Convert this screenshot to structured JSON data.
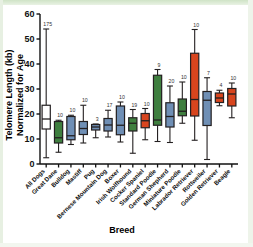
{
  "figure": {
    "background_color": "#ffffff",
    "frame_color": "#dfecd8"
  },
  "axes": {
    "y_title_line1": "Telomere Length (kb)",
    "y_title_line2": "Normalized for Age",
    "x_title": "Breed",
    "y_ticks": [
      "0",
      "10",
      "20",
      "30",
      "40",
      "50",
      "60"
    ],
    "y_min": 0,
    "y_max": 60
  },
  "colors": {
    "white_box": "#ffffff",
    "green_box": "#3f7f3f",
    "blue_box": "#6f8fb5",
    "red_box": "#d8451e",
    "outline": "#231f20"
  },
  "chart_data": {
    "type": "box",
    "title": "",
    "xlabel": "Breed",
    "ylabel": "Telomere Length (kb) Normalized for Age",
    "ylim": [
      0,
      60
    ],
    "grid": false,
    "legend": "none",
    "categories": [
      "All Dogs",
      "Great Dane",
      "Bulldog",
      "Mastiff",
      "Pug",
      "Bernese Mountain Dog",
      "Boxer",
      "Irish Wolfhound",
      "Cocker Spaniel",
      "Standard Poodle",
      "German Shepherd",
      "Miniature Poodle",
      "Labrador Retriever",
      "Rottweiler",
      "Golden Retriever",
      "Beagle"
    ],
    "n_labels": [
      "175",
      "10",
      "10",
      "10",
      "3",
      "17",
      "10",
      "19",
      "10",
      "9",
      "20",
      "10",
      "10",
      "7",
      "4",
      "10"
    ],
    "boxes": [
      {
        "breed": "All Dogs",
        "color": "#ffffff",
        "whisker_low": 2.5,
        "q1": 14.0,
        "median": 18.0,
        "q3": 23.5,
        "whisker_high": 54.0,
        "n": "175"
      },
      {
        "breed": "Great Dane",
        "color": "#3f7f3f",
        "whisker_low": 4.7,
        "q1": 8.4,
        "median": 10.5,
        "q3": 17.0,
        "whisker_high": 17.5,
        "n": "10"
      },
      {
        "breed": "Bulldog",
        "color": "#6f8fb5",
        "whisker_low": 7.8,
        "q1": 9.7,
        "median": 11.3,
        "q3": 19.0,
        "whisker_high": 19.5,
        "n": "10"
      },
      {
        "breed": "Mastiff",
        "color": "#6f8fb5",
        "whisker_low": 8.4,
        "q1": 11.8,
        "median": 14.2,
        "q3": 17.0,
        "whisker_high": 23.5,
        "n": "10"
      },
      {
        "breed": "Pug",
        "color": "#6f8fb5",
        "whisker_low": 10.5,
        "q1": 13.6,
        "median": 14.8,
        "q3": 15.8,
        "whisker_high": 16.0,
        "n": "3"
      },
      {
        "breed": "Bernese Mountain Dog",
        "color": "#6f8fb5",
        "whisker_low": 10.8,
        "q1": 13.2,
        "median": 15.6,
        "q3": 18.2,
        "whisker_high": 21.5,
        "n": "17"
      },
      {
        "breed": "Boxer",
        "color": "#6f8fb5",
        "whisker_low": 8.8,
        "q1": 11.7,
        "median": 15.5,
        "q3": 23.2,
        "whisker_high": 24.8,
        "n": "10"
      },
      {
        "breed": "Irish Wolfhound",
        "color": "#3f7f3f",
        "whisker_low": 4.3,
        "q1": 13.2,
        "median": 16.3,
        "q3": 18.5,
        "whisker_high": 21.8,
        "n": "19"
      },
      {
        "breed": "Cocker Spaniel",
        "color": "#d8451e",
        "whisker_low": 9.7,
        "q1": 14.5,
        "median": 17.3,
        "q3": 20.2,
        "whisker_high": 22.2,
        "n": "10"
      },
      {
        "breed": "Standard Poodle",
        "color": "#3f7f3f",
        "whisker_low": 9.0,
        "q1": 15.5,
        "median": 17.6,
        "q3": 35.5,
        "whisker_high": 37.8,
        "n": "9"
      },
      {
        "breed": "German Shepherd",
        "color": "#6f8fb5",
        "whisker_low": 8.6,
        "q1": 14.8,
        "median": 19.0,
        "q3": 24.5,
        "whisker_high": 31.2,
        "n": "20"
      },
      {
        "breed": "Miniature Poodle",
        "color": "#3f7f3f",
        "whisker_low": 16.3,
        "q1": 19.3,
        "median": 21.1,
        "q3": 26.0,
        "whisker_high": 32.8,
        "n": "10"
      },
      {
        "breed": "Labrador Retriever",
        "color": "#d8451e",
        "whisker_low": 9.5,
        "q1": 19.2,
        "median": 25.8,
        "q3": 44.3,
        "whisker_high": 53.8,
        "n": "10"
      },
      {
        "breed": "Rottweiler",
        "color": "#6f8fb5",
        "whisker_low": 1.8,
        "q1": 15.4,
        "median": 25.5,
        "q3": 29.0,
        "whisker_high": 34.5,
        "n": "7"
      },
      {
        "breed": "Golden Retriever",
        "color": "#d8451e",
        "whisker_low": 23.3,
        "q1": 24.6,
        "median": 26.4,
        "q3": 28.4,
        "whisker_high": 29.5,
        "n": "4"
      },
      {
        "breed": "Beagle",
        "color": "#d8451e",
        "whisker_low": 18.5,
        "q1": 23.2,
        "median": 28.0,
        "q3": 30.2,
        "whisker_high": 32.4,
        "n": "10"
      }
    ]
  }
}
